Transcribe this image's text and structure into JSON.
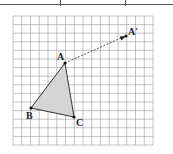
{
  "diagram": {
    "type": "translation-on-grid",
    "grid": {
      "left": 13,
      "top": 16,
      "right": 153,
      "bottom": 145,
      "cols": 16,
      "rows": 15,
      "line_color": "#9a9a9a",
      "border_color": "#8a8a8a"
    },
    "triangle": {
      "fill": "#d4d4d4",
      "stroke": "#333333",
      "points": {
        "A": {
          "x": 65,
          "y": 63,
          "label": "A"
        },
        "B": {
          "x": 31,
          "y": 108,
          "label": "B"
        },
        "C": {
          "x": 74,
          "y": 117,
          "label": "C"
        }
      }
    },
    "image_point": {
      "x": 126,
      "y": 36,
      "label": "A′"
    },
    "translation_arrow": {
      "from": "A",
      "to": "A′",
      "style": "dashed"
    }
  },
  "top_table": {
    "tick_positions": [
      60,
      125
    ]
  }
}
